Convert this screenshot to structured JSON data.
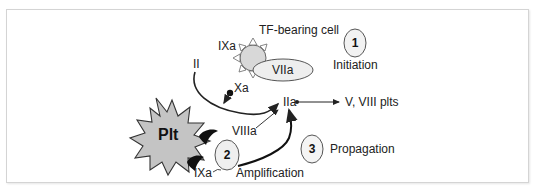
{
  "diagram": {
    "title_label": "TF-bearing cell",
    "cell_enzyme_left": "IXa",
    "cell_enzyme_bound": "VIIa",
    "factor_ii": "II",
    "factor_xa": "Xa",
    "factor_iia": "IIa",
    "iia_targets": "V, VIII plts",
    "platelet": "Plt",
    "platelet_viiia": "VIIIa",
    "platelet_ixa": "IXa",
    "steps": [
      {
        "number": "1",
        "label": "Initiation"
      },
      {
        "number": "2",
        "label": "Amplification"
      },
      {
        "number": "3",
        "label": "Propagation"
      }
    ]
  },
  "colors": {
    "cell_fill": "#d8d8d8",
    "platelet_fill": "#c4c4c4",
    "ellipse_fill": "#eeeeee",
    "stroke": "#222222",
    "frame_border": "#d4d4d4"
  }
}
